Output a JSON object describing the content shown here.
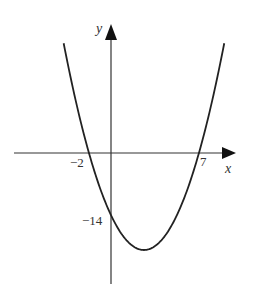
{
  "chart_data": {
    "type": "line",
    "title": "",
    "function": "y = (x + 2)(x - 7)",
    "xlabel": "x",
    "ylabel": "y",
    "x_ticks_labeled": [
      -2,
      7
    ],
    "y_ticks_labeled": [
      -14
    ],
    "tick_labels": {
      "x_left_root": "−2",
      "x_right_root": "7",
      "y_intercept": "−14"
    },
    "x_intercepts": [
      -2,
      7
    ],
    "y_intercept": -14,
    "vertex": [
      2.5,
      -20.25
    ],
    "x": [
      -4.07,
      -3,
      -2,
      -1,
      0,
      1,
      2,
      2.5,
      3,
      4,
      5,
      6,
      7,
      8,
      9.07
    ],
    "values": [
      22.97,
      10,
      0,
      -8,
      -14,
      -18,
      -20,
      -20.25,
      -20,
      -18,
      -14,
      -8,
      0,
      10,
      22.97
    ],
    "grid": false,
    "legend": null,
    "colors": {
      "curve": "#222222",
      "axes": "#333333"
    }
  },
  "labels": {
    "x_axis": "x",
    "y_axis": "y",
    "neg2": "−2",
    "seven": "7",
    "neg14": "−14"
  }
}
